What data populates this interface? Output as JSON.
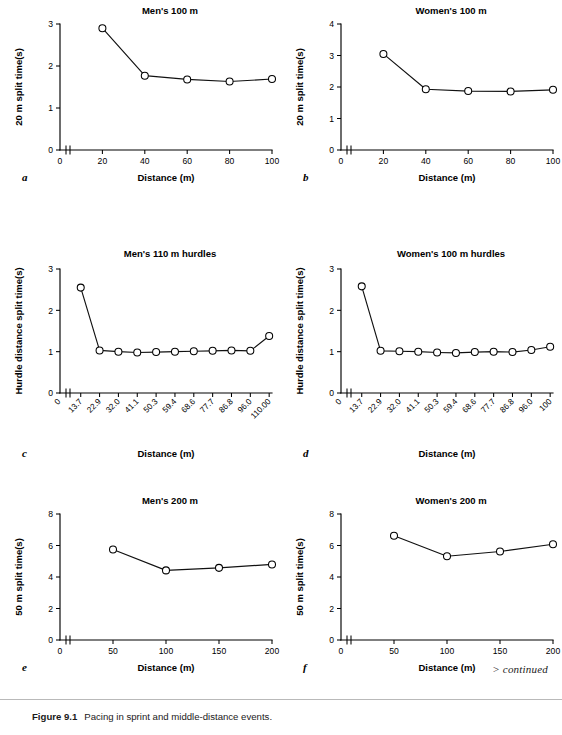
{
  "figure": {
    "caption_label": "Figure 9.1",
    "caption_text": "Pacing in sprint and middle-distance events.",
    "continued_note": "> continued"
  },
  "chart_data": [
    {
      "id": "a",
      "panel_letter": "a",
      "type": "line",
      "title": "Men's 100 m",
      "xlabel": "Distance (m)",
      "ylabel": "20 m split time(s)",
      "x": [
        20,
        40,
        60,
        80,
        100
      ],
      "xtick_labels": [
        "0",
        "20",
        "40",
        "60",
        "80",
        "100"
      ],
      "xtick_values": [
        0,
        20,
        40,
        60,
        80,
        100
      ],
      "values": [
        2.9,
        1.77,
        1.68,
        1.63,
        1.69
      ],
      "xlim": [
        0,
        100
      ],
      "ylim": [
        0,
        3
      ],
      "ytick_values": [
        0,
        1,
        2,
        3
      ],
      "ytick_labels": [
        "0",
        "1",
        "2",
        "3"
      ],
      "grid": false,
      "axis_break": true,
      "rotated_xticks": false
    },
    {
      "id": "b",
      "panel_letter": "b",
      "type": "line",
      "title": "Women's 100 m",
      "xlabel": "Distance (m)",
      "ylabel": "20 m split time(s)",
      "x": [
        20,
        40,
        60,
        80,
        100
      ],
      "xtick_labels": [
        "0",
        "20",
        "40",
        "60",
        "80",
        "100"
      ],
      "xtick_values": [
        0,
        20,
        40,
        60,
        80,
        100
      ],
      "values": [
        3.05,
        1.93,
        1.87,
        1.86,
        1.91
      ],
      "xlim": [
        0,
        100
      ],
      "ylim": [
        0,
        4
      ],
      "ytick_values": [
        0,
        1,
        2,
        3,
        4
      ],
      "ytick_labels": [
        "0",
        "1",
        "2",
        "3",
        "4"
      ],
      "grid": false,
      "axis_break": true,
      "rotated_xticks": false
    },
    {
      "id": "c",
      "panel_letter": "c",
      "type": "line",
      "title": "Men's 110 m hurdles",
      "xlabel": "Distance (m)",
      "ylabel": "Hurdle distance split time(s)",
      "xtick_labels": [
        "0",
        "13.7",
        "22.9",
        "32.0",
        "41.1",
        "50.3",
        "59.4",
        "68.6",
        "77.7",
        "86.8",
        "96.0",
        "110.00"
      ],
      "categories": [
        "13.7",
        "22.9",
        "32.0",
        "41.1",
        "50.3",
        "59.4",
        "68.6",
        "77.7",
        "86.8",
        "96.0",
        "110.00"
      ],
      "values": [
        2.55,
        1.03,
        1.0,
        0.98,
        0.99,
        1.0,
        1.01,
        1.02,
        1.03,
        1.02,
        1.38
      ],
      "ylim": [
        0,
        3
      ],
      "ytick_values": [
        0,
        1,
        2,
        3
      ],
      "ytick_labels": [
        "0",
        "1",
        "2",
        "3"
      ],
      "grid": false,
      "axis_break": true,
      "rotated_xticks": true
    },
    {
      "id": "d",
      "panel_letter": "d",
      "type": "line",
      "title": "Women's 100 m hurdles",
      "xlabel": "Distance (m)",
      "ylabel": "Hurdle distance split time(s)",
      "xtick_labels": [
        "0",
        "13.7",
        "22.9",
        "32.0",
        "41.1",
        "50.3",
        "59.4",
        "68.6",
        "77.7",
        "86.8",
        "96.0",
        "100"
      ],
      "categories": [
        "13.7",
        "22.9",
        "32.0",
        "41.1",
        "50.3",
        "59.4",
        "68.6",
        "77.7",
        "86.8",
        "96.0",
        "100"
      ],
      "values": [
        2.58,
        1.02,
        1.01,
        1.0,
        0.98,
        0.97,
        0.99,
        1.0,
        0.99,
        1.04,
        1.12
      ],
      "ylim": [
        0,
        3
      ],
      "ytick_values": [
        0,
        1,
        2,
        3
      ],
      "ytick_labels": [
        "0",
        "1",
        "2",
        "3"
      ],
      "grid": false,
      "axis_break": true,
      "rotated_xticks": true
    },
    {
      "id": "e",
      "panel_letter": "e",
      "type": "line",
      "title": "Men's 200 m",
      "xlabel": "Distance (m)",
      "ylabel": "50 m split time(s)",
      "x": [
        50,
        100,
        150,
        200
      ],
      "xtick_labels": [
        "0",
        "50",
        "100",
        "150",
        "200"
      ],
      "xtick_values": [
        0,
        50,
        100,
        150,
        200
      ],
      "values": [
        5.75,
        4.42,
        4.58,
        4.8
      ],
      "xlim": [
        0,
        200
      ],
      "ylim": [
        0,
        8
      ],
      "ytick_values": [
        0,
        2,
        4,
        6,
        8
      ],
      "ytick_labels": [
        "0",
        "2",
        "4",
        "6",
        "8"
      ],
      "grid": false,
      "axis_break": true,
      "rotated_xticks": false
    },
    {
      "id": "f",
      "panel_letter": "f",
      "type": "line",
      "title": "Women's 200 m",
      "xlabel": "Distance (m)",
      "ylabel": "50 m split time(s)",
      "x": [
        50,
        100,
        150,
        200
      ],
      "xtick_labels": [
        "0",
        "50",
        "100",
        "150",
        "200"
      ],
      "xtick_values": [
        0,
        50,
        100,
        150,
        200
      ],
      "values": [
        6.62,
        5.32,
        5.62,
        6.08
      ],
      "xlim": [
        0,
        200
      ],
      "ylim": [
        0,
        8
      ],
      "ytick_values": [
        0,
        2,
        4,
        6,
        8
      ],
      "ytick_labels": [
        "0",
        "2",
        "4",
        "6",
        "8"
      ],
      "grid": false,
      "axis_break": true,
      "rotated_xticks": false
    }
  ],
  "style": {
    "line_color": "#111111",
    "marker_fill": "#ffffff",
    "marker_stroke": "#000000",
    "axis_color": "#000000",
    "rule_color": "#b9b9b9"
  }
}
